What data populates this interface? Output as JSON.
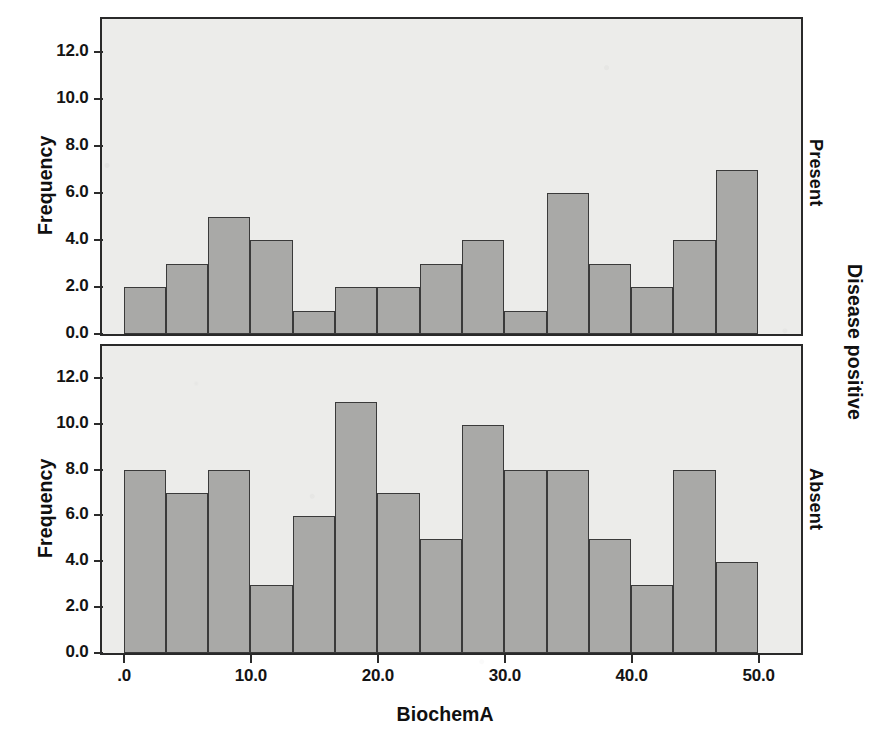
{
  "figure": {
    "xlabel": "BiochemA",
    "outer_panel_label": "Disease positive"
  },
  "chart_data": {
    "type": "bar",
    "title": "",
    "subtitle": "",
    "xlabel": "BiochemA",
    "ylabel": "Frequency",
    "outer_label": "Disease positive",
    "grid": false,
    "legend": "none",
    "layout": "2 stacked histogram panels sharing x-axis",
    "bin_width": 3.3333,
    "xlim": [
      -1.7,
      53.3
    ],
    "xticks": [
      0,
      10,
      20,
      30,
      40,
      50
    ],
    "xticklabels": [
      ".0",
      "10.0",
      "20.0",
      "30.0",
      "40.0",
      "50.0"
    ],
    "panels": [
      {
        "name": "Present",
        "strip_label": "Present",
        "ylabel": "Frequency",
        "ylim": [
          0,
          13.4
        ],
        "yticks": [
          0,
          2,
          4,
          6,
          8,
          10,
          12
        ],
        "yticklabels": [
          "0.0",
          "2.0",
          "4.0",
          "6.0",
          "8.0",
          "10.0",
          "12.0"
        ],
        "bin_starts": [
          0.0,
          3.33,
          6.67,
          10.0,
          13.33,
          16.67,
          20.0,
          23.33,
          26.67,
          30.0,
          33.33,
          36.67,
          40.0,
          43.33,
          46.67
        ],
        "bin_ends": [
          3.33,
          6.67,
          10.0,
          13.33,
          16.67,
          20.0,
          23.33,
          26.67,
          30.0,
          33.33,
          36.67,
          40.0,
          43.33,
          46.67,
          50.0
        ],
        "values": [
          2,
          3,
          5,
          4,
          1,
          2,
          2,
          3,
          4,
          1,
          6,
          3,
          2,
          4,
          7
        ]
      },
      {
        "name": "Absent",
        "strip_label": "Absent",
        "ylabel": "Frequency",
        "ylim": [
          0,
          13.4
        ],
        "yticks": [
          0,
          2,
          4,
          6,
          8,
          10,
          12
        ],
        "yticklabels": [
          "0.0",
          "2.0",
          "4.0",
          "6.0",
          "8.0",
          "10.0",
          "12.0"
        ],
        "bin_starts": [
          0.0,
          3.33,
          6.67,
          10.0,
          13.33,
          16.67,
          20.0,
          23.33,
          26.67,
          30.0,
          33.33,
          36.67,
          40.0,
          43.33,
          46.67
        ],
        "bin_ends": [
          3.33,
          6.67,
          10.0,
          13.33,
          16.67,
          20.0,
          23.33,
          26.67,
          30.0,
          33.33,
          36.67,
          40.0,
          43.33,
          46.67,
          50.0
        ],
        "values": [
          8,
          7,
          8,
          3,
          6,
          11,
          7,
          5,
          10,
          8,
          8,
          5,
          3,
          8,
          4
        ]
      }
    ],
    "colors": {
      "bar_fill": "#a9a9a7",
      "bar_edge": "#3a3a3a",
      "panel_bg": "#ececea",
      "panel_border": "#2a2a2a",
      "text": "#101010"
    }
  }
}
